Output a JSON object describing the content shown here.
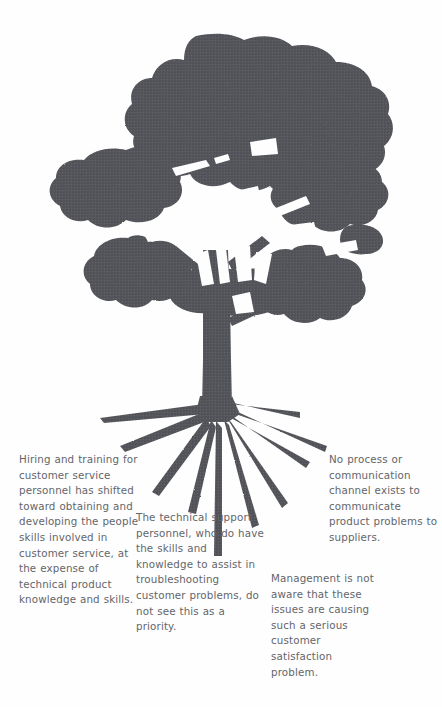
{
  "diagram": {
    "kind": "issue-tree",
    "figure_name": "tree-silhouette",
    "colors": {
      "background": "#fefefe",
      "tree_fill": "#55575c",
      "tree_fill_shade": "#4a4c51",
      "text": "#63656a"
    },
    "parts": {
      "canopy_label": "canopy",
      "trunk_label": "trunk",
      "roots_label": "roots"
    }
  },
  "notes": [
    {
      "id": "hiring",
      "name": "note-hiring",
      "text": "Hiring and training for customer service personnel has shifted toward obtaining and developing the people skills involved in customer service, at the expense of technical product knowledge and skills."
    },
    {
      "id": "technical",
      "name": "note-technical",
      "text": "The technical support personnel, who do have the skills and knowledge to assist in troubleshooting customer problems, do not see this as a priority."
    },
    {
      "id": "noprocess",
      "name": "note-noprocess",
      "text": "No process or communication channel exists to communicate product problems to suppliers."
    },
    {
      "id": "management",
      "name": "note-management",
      "text": "Management is not aware that these issues are causing such a serious customer satisfaction problem."
    }
  ]
}
